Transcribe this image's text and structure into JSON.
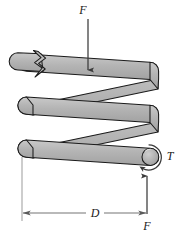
{
  "figure": {
    "background_color": "#ffffff",
    "width": 182,
    "height": 235,
    "colors": {
      "wire_fill": "#b3b3b3",
      "wire_fill_light": "#c4c4c4",
      "wire_outline": "#1a1a1a",
      "arrow": "#3a3a3a",
      "dimension_line": "#5a5a5a",
      "extension_line": "#8a8a8a",
      "label": "#1a1a1a"
    },
    "labels": {
      "force_top": "F",
      "force_bottom": "F",
      "torque": "T",
      "diameter": "D"
    },
    "annotations": {
      "force_top_direction": "down",
      "force_bottom_direction": "up",
      "torque_direction": "counterclockwise",
      "diameter_dimension": "mean coil diameter D",
      "break_symbol": "zigzag-break indicating spring continues"
    },
    "geometry": {
      "coil_turns_shown": 3,
      "wire_thickness_px": 17,
      "coil_left_x": 18,
      "coil_right_x": 160,
      "force_top_x": 88,
      "force_top_y_start": 18,
      "force_top_y_end": 71,
      "force_bottom_x": 147,
      "force_bottom_y_start": 214,
      "force_bottom_y_end": 176,
      "dimension_y": 213,
      "dimension_x_start": 22,
      "dimension_x_end": 147
    }
  }
}
